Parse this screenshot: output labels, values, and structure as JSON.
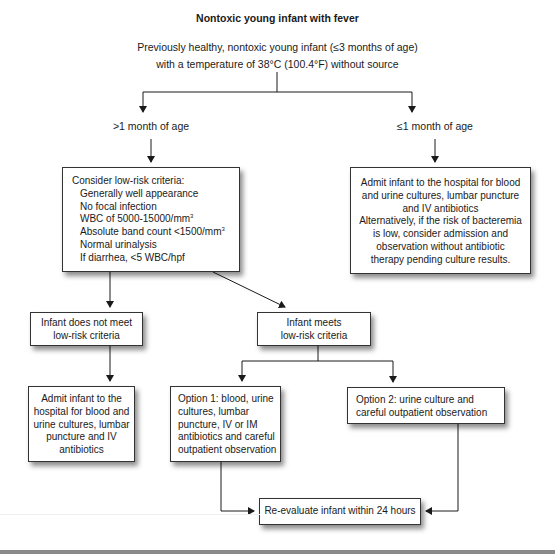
{
  "diagram": {
    "title": "Nontoxic young infant with fever",
    "root": {
      "line1": "Previously healthy, nontoxic young infant (≤3 months of age)",
      "line2": "with a temperature of 38°C (100.4°F) without source"
    },
    "branches": {
      "older": {
        "label": ">1 month of age"
      },
      "younger": {
        "label": "≤1 month of age"
      }
    },
    "criteria_box": {
      "heading": "Consider low-risk criteria:",
      "items": [
        "Generally well appearance",
        "No focal infection",
        "WBC of 5000-15000/mm",
        "Absolute band count <1500/mm",
        "Normal urinalysis",
        "If diarrhea, <5 WBC/hpf"
      ],
      "superscript": "3"
    },
    "neonate_box": {
      "lines": [
        "Admit infant to the hospital for blood",
        "and urine cultures, lumbar puncture",
        "and IV antibiotics",
        "Alternatively, if the risk of bacteremia",
        "is low, consider admission and",
        "observation without antibiotic",
        "therapy pending culture results."
      ]
    },
    "not_low_risk_box": {
      "lines": [
        "Infant does not meet",
        "low-risk criteria"
      ]
    },
    "low_risk_box": {
      "lines": [
        "Infant meets",
        "low-risk criteria"
      ]
    },
    "admit_box": {
      "lines": [
        "Admit infant to the",
        "hospital for blood and",
        "urine cultures, lumbar",
        "puncture and IV",
        "antibiotics"
      ]
    },
    "option1_box": {
      "lines": [
        "Option 1: blood, urine",
        "cultures, lumbar",
        "puncture, IV or IM",
        "antibiotics and careful",
        "outpatient observation"
      ]
    },
    "option2_box": {
      "lines": [
        "Option 2: urine culture and",
        "careful outpatient observation"
      ]
    },
    "reevaluate_box": {
      "text": "Re-evaluate infant within 24 hours"
    }
  },
  "colors": {
    "line": "#1a1a1a",
    "box_border": "#333333",
    "shadow": "#777777",
    "bottom_rule": "#8a8a8a"
  }
}
